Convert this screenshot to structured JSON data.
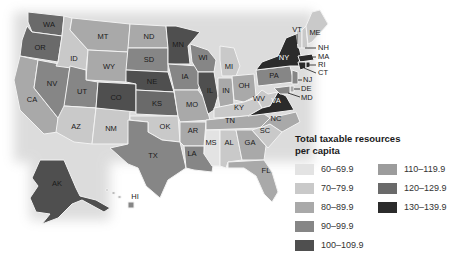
{
  "legend": {
    "title_line1": "Total taxable resources",
    "title_line2": "per capita",
    "items": [
      {
        "label": "60–69.9",
        "color": "#e3e3e3"
      },
      {
        "label": "70–79.9",
        "color": "#c9c9c9"
      },
      {
        "label": "80–89.9",
        "color": "#a9a9a9"
      },
      {
        "label": "90–99.9",
        "color": "#868686"
      },
      {
        "label": "100–109.9",
        "color": "#4f4f4f"
      },
      {
        "label": "110–119.9",
        "color": "#9c9c9c"
      },
      {
        "label": "120–129.9",
        "color": "#6a6a6a"
      },
      {
        "label": "130–139.9",
        "color": "#2b2b2b"
      }
    ]
  },
  "states": {
    "WA": "WA",
    "OR": "OR",
    "CA": "CA",
    "NV": "NV",
    "ID": "ID",
    "MT": "MT",
    "WY": "WY",
    "UT": "UT",
    "AZ": "AZ",
    "NM": "NM",
    "CO": "CO",
    "ND": "ND",
    "SD": "SD",
    "NE": "NE",
    "KS": "KS",
    "OK": "OK",
    "TX": "TX",
    "MN": "MN",
    "IA": "IA",
    "MO": "MO",
    "AR": "AR",
    "LA": "LA",
    "WI": "WI",
    "IL": "IL",
    "MS": "MS",
    "MI": "MI",
    "IN": "IN",
    "KY": "KY",
    "TN": "TN",
    "AL": "AL",
    "GA": "GA",
    "FL": "FL",
    "SC": "SC",
    "NC": "NC",
    "OH": "OH",
    "WV": "WV",
    "VA": "VA",
    "PA": "PA",
    "NY": "NY",
    "VT": "VT",
    "ME": "ME",
    "NH": "NH",
    "MA": "MA",
    "RI": "RI",
    "CT": "CT",
    "NJ": "NJ",
    "DE": "DE",
    "MD": "MD",
    "AK": "AK",
    "HI": "HI"
  }
}
